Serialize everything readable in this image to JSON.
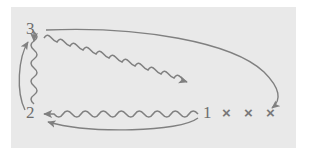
{
  "figure": {
    "panel_background": "#e9e9e9",
    "page_background": "#ffffff",
    "stroke_color": "#808080",
    "label_color": "#6e6e6e",
    "x_mark_color": "#787878"
  },
  "states": [
    {
      "id": "3",
      "label": "3",
      "x": 26,
      "y": 20
    },
    {
      "id": "2",
      "label": "2",
      "x": 26,
      "y": 104
    },
    {
      "id": "1",
      "label": "1",
      "x": 203,
      "y": 104
    }
  ],
  "x_marks": [
    {
      "label": "×",
      "x": 222,
      "y": 105
    },
    {
      "label": "×",
      "x": 244,
      "y": 105
    },
    {
      "label": "×",
      "x": 266,
      "y": 105
    }
  ],
  "transitions": [
    {
      "id": "wavy-3-to-1",
      "style": "wavy",
      "from": "3",
      "to": "1",
      "arrowhead": "end"
    },
    {
      "id": "wavy-1-to-2",
      "style": "wavy",
      "from": "1",
      "to": "2",
      "arrowhead": "end"
    },
    {
      "id": "wavy-2-to-3",
      "style": "wavy",
      "from": "2",
      "to": "3",
      "arrowhead": "end"
    },
    {
      "id": "curve-1-to-2",
      "style": "smooth",
      "from": "1",
      "to": "2",
      "arrowhead": "end"
    },
    {
      "id": "curve-2-to-3",
      "style": "smooth",
      "from": "2",
      "to": "3",
      "arrowhead": "end"
    },
    {
      "id": "curve-3-to-x",
      "style": "smooth",
      "from": "3",
      "to": "x-marks",
      "arrowhead": "end"
    }
  ]
}
